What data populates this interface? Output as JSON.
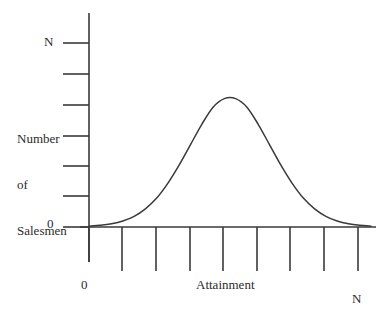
{
  "chart_data": {
    "type": "line",
    "title": "",
    "subtitle": "",
    "xlabel": "Attainment",
    "ylabel": "Number of Salesmen",
    "ylabel_lines": [
      "Number",
      "of",
      "Salesmen"
    ],
    "x_axis_min_label": "0",
    "x_axis_max_label": "N",
    "y_axis_min_label": "0",
    "y_axis_max_label": "N",
    "xlim": [
      0,
      1
    ],
    "ylim": [
      0,
      1
    ],
    "grid": false,
    "legend": null,
    "annotations": [],
    "y_tick_count": 7,
    "y_tick_values": [
      0,
      0.1667,
      0.3333,
      0.5,
      0.6667,
      0.8333,
      1.0
    ],
    "x_tick_count": 9,
    "x_tick_values": [
      0,
      0.125,
      0.25,
      0.375,
      0.5,
      0.625,
      0.75,
      0.875,
      1.0
    ],
    "curve_peak_x": 0.49,
    "curve_peak_y": 0.605,
    "x": [
      0.0,
      0.04,
      0.08,
      0.12,
      0.16,
      0.2,
      0.24,
      0.28,
      0.32,
      0.36,
      0.4,
      0.44,
      0.48,
      0.52,
      0.56,
      0.6,
      0.64,
      0.68,
      0.72,
      0.76,
      0.8,
      0.84,
      0.88,
      0.92,
      0.96,
      1.0
    ],
    "values": [
      0.004,
      0.008,
      0.015,
      0.028,
      0.05,
      0.085,
      0.135,
      0.205,
      0.29,
      0.385,
      0.48,
      0.56,
      0.6,
      0.6,
      0.56,
      0.48,
      0.385,
      0.29,
      0.205,
      0.135,
      0.085,
      0.05,
      0.028,
      0.015,
      0.008,
      0.004
    ]
  },
  "style": {
    "line_color": "#3a3a3a",
    "axis_color": "#3a3a3a",
    "tick_color": "#3a3a3a",
    "text_color": "#2b2b2b",
    "background": "#ffffff"
  },
  "icons": {
    "curve": "bell-curve-icon"
  }
}
